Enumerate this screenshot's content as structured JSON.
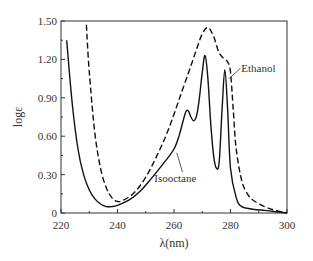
{
  "chart_data": {
    "type": "line",
    "title": "",
    "xlabel": "λ(nm)",
    "ylabel": "logε",
    "xlim": [
      220,
      300
    ],
    "ylim": [
      0,
      1.5
    ],
    "xticks": [
      "220",
      "240",
      "260",
      "280",
      "300"
    ],
    "yticks": [
      "0",
      "0.30",
      "0.60",
      "0.90",
      "1.20",
      "1.50"
    ],
    "grid": false,
    "legend": "inline annotations",
    "series": [
      {
        "name": "Isooctane",
        "style": "solid",
        "x": [
          222,
          224,
          226,
          228,
          230,
          232,
          234,
          236,
          238,
          240,
          244,
          248,
          252,
          256,
          260,
          262,
          264,
          265,
          266,
          267,
          268,
          269,
          270,
          271,
          272,
          273,
          274,
          275,
          276,
          277,
          278,
          279,
          280,
          282,
          284,
          288,
          292,
          296,
          300
        ],
        "y": [
          1.35,
          0.85,
          0.5,
          0.3,
          0.18,
          0.11,
          0.07,
          0.05,
          0.05,
          0.06,
          0.1,
          0.17,
          0.27,
          0.38,
          0.5,
          0.62,
          0.78,
          0.8,
          0.75,
          0.72,
          0.76,
          0.9,
          1.1,
          1.23,
          1.05,
          0.7,
          0.45,
          0.35,
          0.4,
          0.8,
          1.12,
          0.8,
          0.35,
          0.12,
          0.05,
          0.03,
          0.02,
          0.01,
          0.0
        ]
      },
      {
        "name": "Ethanol",
        "style": "dashed",
        "x": [
          229,
          230,
          232,
          234,
          236,
          238,
          240,
          242,
          246,
          250,
          254,
          258,
          262,
          266,
          268,
          270,
          272,
          274,
          276,
          278,
          279,
          280,
          281,
          282,
          284,
          286,
          288,
          292,
          296,
          300
        ],
        "y": [
          1.47,
          1.1,
          0.62,
          0.35,
          0.2,
          0.12,
          0.09,
          0.1,
          0.16,
          0.28,
          0.45,
          0.65,
          0.9,
          1.15,
          1.28,
          1.4,
          1.45,
          1.38,
          1.25,
          1.2,
          1.18,
          1.1,
          0.8,
          0.5,
          0.25,
          0.15,
          0.1,
          0.05,
          0.02,
          0.0
        ]
      }
    ],
    "annotations": [
      {
        "text": "Ethanol",
        "x": 289,
        "y": 1.13
      },
      {
        "text": "Isooctane",
        "x": 259,
        "y": 0.28
      }
    ]
  },
  "labels": {
    "ethanol": "Ethanol",
    "isooctane": "Isooctane",
    "xlabel": "λ(nm)",
    "ylabel": "logε"
  }
}
